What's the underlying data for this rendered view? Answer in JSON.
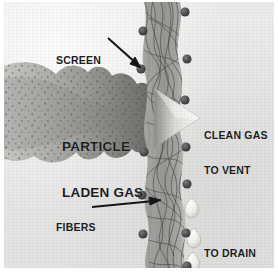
{
  "figure": {
    "background_color": "#e7e7e6",
    "ink_color": "#1c1c1c"
  },
  "labels": {
    "screen": "SCREEN",
    "fibers": "FIBERS",
    "particle_laden_gas_line1": "PARTICLE",
    "particle_laden_gas_line2": "LADEN GAS",
    "clean_gas_line1": "CLEAN GAS",
    "clean_gas_line2": "TO VENT",
    "to_drain": "TO DRAIN"
  },
  "diagram": {
    "type": "cross-section-illustration",
    "elements": [
      {
        "name": "particle-laden-gas-stream",
        "side": "left",
        "color": "#8e8e8c",
        "description": "lobed speckled gas cloud flowing right, tapering into an arrow"
      },
      {
        "name": "fiber-screen-band",
        "orientation": "vertical",
        "x_range_px": [
          140,
          182
        ],
        "color": "#9a9a98",
        "description": "tangled fibrous mesh band spanning full height"
      },
      {
        "name": "clean-gas-arrowhead",
        "side": "right",
        "color": "#f4f4f2",
        "description": "white arrowhead emerging through the screen"
      },
      {
        "name": "drain-droplets",
        "side": "right",
        "count": 3,
        "color": "#f2f2f0",
        "description": "teardrop shapes running down the downstream face"
      }
    ],
    "fasteners": {
      "name": "rivet",
      "color": "#4a4a4a",
      "radius_px": 4.5,
      "left_column_y": [
        29,
        67,
        150,
        193,
        232
      ],
      "right_column_y": [
        10,
        57,
        98,
        145,
        182,
        231,
        266
      ]
    },
    "leader_arrows": [
      {
        "name": "screen-leader",
        "from": [
          106,
          39
        ],
        "to": [
          138,
          67
        ]
      },
      {
        "name": "fibers-leader",
        "from": [
          90,
          206
        ],
        "to": [
          157,
          199
        ]
      }
    ]
  }
}
